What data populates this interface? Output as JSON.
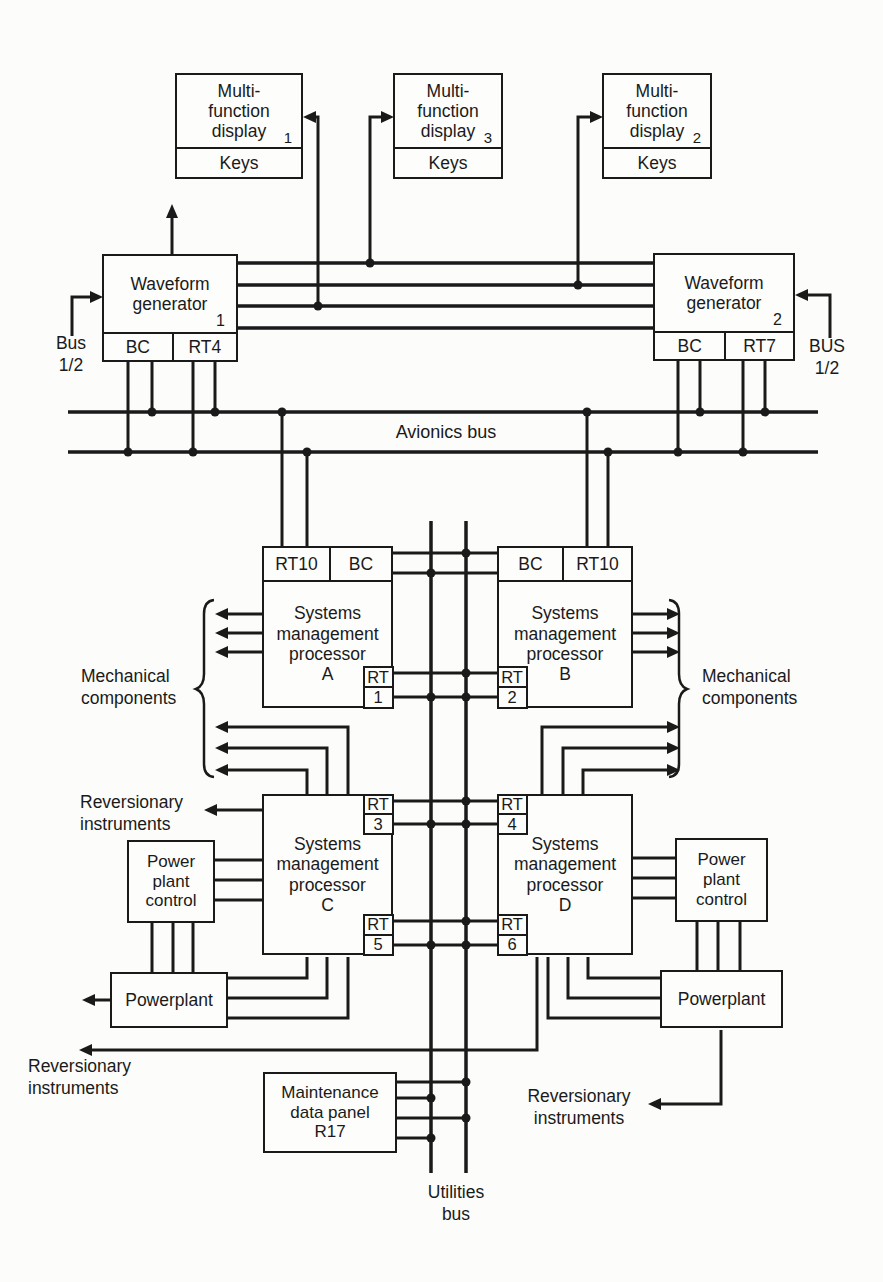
{
  "displays": [
    {
      "line1": "Multi-",
      "line2": "function",
      "line3": "display",
      "number": "1",
      "keys_label": "Keys"
    },
    {
      "line1": "Multi-",
      "line2": "function",
      "line3": "display",
      "number": "3",
      "keys_label": "Keys"
    },
    {
      "line1": "Multi-",
      "line2": "function",
      "line3": "display",
      "number": "2",
      "keys_label": "Keys"
    }
  ],
  "waveform_generators": [
    {
      "line1": "Waveform",
      "line2": "generator",
      "number": "1",
      "bc_label": "BC",
      "rt_label": "RT4"
    },
    {
      "line1": "Waveform",
      "line2": "generator",
      "number": "2",
      "bc_label": "BC",
      "rt_label": "RT7"
    }
  ],
  "bus_labels": {
    "left_line1": "Bus",
    "left_line2": "1/2",
    "right_line1": "BUS",
    "right_line2": "1/2",
    "avionics": "Avionics bus",
    "utilities_line1": "Utilities",
    "utilities_line2": "bus"
  },
  "processors": {
    "a": {
      "line1": "Systems",
      "line2": "management",
      "line3": "processor",
      "letter": "A",
      "top_left": "RT10",
      "top_right": "BC",
      "rt_line1": "RT",
      "rt_line2": "1"
    },
    "b": {
      "line1": "Systems",
      "line2": "management",
      "line3": "processor",
      "letter": "B",
      "top_left": "BC",
      "top_right": "RT10",
      "rt_line1": "RT",
      "rt_line2": "2"
    },
    "c": {
      "line1": "Systems",
      "line2": "management",
      "line3": "processor",
      "letter": "C",
      "rt_top_line1": "RT",
      "rt_top_line2": "3",
      "rt_bottom_line1": "RT",
      "rt_bottom_line2": "5"
    },
    "d": {
      "line1": "Systems",
      "line2": "management",
      "line3": "processor",
      "letter": "D",
      "rt_top_line1": "RT",
      "rt_top_line2": "4",
      "rt_bottom_line1": "RT",
      "rt_bottom_line2": "6"
    }
  },
  "side_labels": {
    "mechanical_left_line1": "Mechanical",
    "mechanical_left_line2": "components",
    "mechanical_right_line1": "Mechanical",
    "mechanical_right_line2": "components",
    "reversionary_upper_left_line1": "Reversionary",
    "reversionary_upper_left_line2": "instruments",
    "reversionary_lower_left_line1": "Reversionary",
    "reversionary_lower_left_line2": "instruments",
    "reversionary_lower_right_line1": "Reversionary",
    "reversionary_lower_right_line2": "instruments"
  },
  "power_units": {
    "left_control_line1": "Power",
    "left_control_line2": "plant",
    "left_control_line3": "control",
    "right_control_line1": "Power",
    "right_control_line2": "plant",
    "right_control_line3": "control",
    "left_plant": "Powerplant",
    "right_plant": "Powerplant"
  },
  "maintenance_panel": {
    "line1": "Maintenance",
    "line2": "data panel",
    "line3": "R17"
  },
  "colors": {
    "ink": "#1a1a1a",
    "paper": "#fcfcfa"
  }
}
